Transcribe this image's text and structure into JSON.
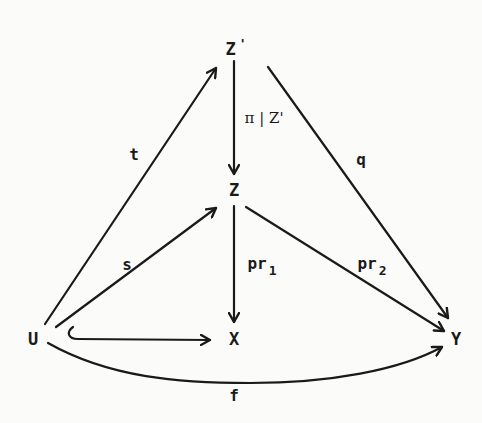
{
  "diagram": {
    "type": "commutative-diagram",
    "nodes": {
      "z_prime": {
        "label": "Z",
        "prime": "'"
      },
      "z": {
        "label": "Z"
      },
      "u": {
        "label": "U"
      },
      "x": {
        "label": "X"
      },
      "y": {
        "label": "Y"
      }
    },
    "arrows": {
      "t": {
        "from": "U",
        "to": "Z'",
        "label": "t"
      },
      "q": {
        "from": "Z'",
        "to": "Y",
        "label": "q"
      },
      "pi_restrict": {
        "from": "Z'",
        "to": "Z",
        "label_main": "π",
        "label_sep": "|",
        "label_sub": "Z'"
      },
      "s": {
        "from": "U",
        "to": "Z",
        "label": "s"
      },
      "pr1": {
        "from": "Z",
        "to": "X",
        "label": "pr",
        "sub": "1"
      },
      "pr2": {
        "from": "Z",
        "to": "Y",
        "label": "pr",
        "sub": "2"
      },
      "inclusion": {
        "from": "U",
        "to": "X",
        "style": "hook"
      },
      "f": {
        "from": "U",
        "to": "Y",
        "label": "f",
        "style": "curved"
      }
    },
    "colors": {
      "ink": "#1a1a1a",
      "paper": "#fbfbf9"
    }
  }
}
